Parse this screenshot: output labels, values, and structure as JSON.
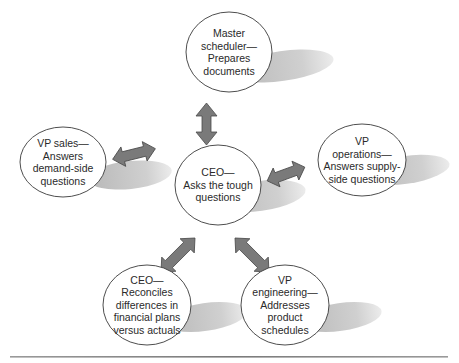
{
  "diagram": {
    "type": "hub-and-spoke",
    "colors": {
      "node_fill": "#ffffff",
      "node_stroke": "#3a3a3a",
      "shadow": "#c8c8c8",
      "arrow_fill": "#7a7a7a",
      "arrow_stroke": "#4a4a4a",
      "rule": "#8a8a8a"
    },
    "center": {
      "id": "ceo-center",
      "lines": [
        "CEO—",
        "Asks the tough",
        "questions"
      ]
    },
    "nodes": [
      {
        "id": "master-scheduler",
        "lines": [
          "Master",
          "scheduler—",
          "Prepares",
          "documents"
        ]
      },
      {
        "id": "vp-sales",
        "lines": [
          "VP sales—",
          "Answers",
          "demand-side",
          "questions"
        ]
      },
      {
        "id": "vp-operations",
        "lines": [
          "VP",
          "operations—",
          "Answers supply-",
          "side questions"
        ]
      },
      {
        "id": "ceo-reconciles",
        "lines": [
          "CEO—",
          "Reconciles",
          "differences in",
          "financial plans",
          "versus actuals"
        ]
      },
      {
        "id": "vp-engineering",
        "lines": [
          "VP",
          "engineering—",
          "Addresses",
          "product",
          "schedules"
        ]
      }
    ],
    "connections": [
      {
        "from": "ceo-center",
        "to": "master-scheduler",
        "bidirectional": true
      },
      {
        "from": "ceo-center",
        "to": "vp-sales",
        "bidirectional": true
      },
      {
        "from": "ceo-center",
        "to": "vp-operations",
        "bidirectional": true
      },
      {
        "from": "ceo-center",
        "to": "ceo-reconciles",
        "bidirectional": true
      },
      {
        "from": "ceo-center",
        "to": "vp-engineering",
        "bidirectional": true
      }
    ]
  }
}
